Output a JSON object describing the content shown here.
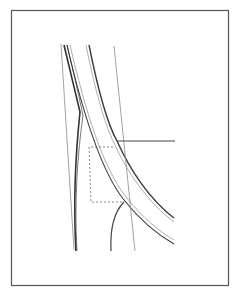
{
  "figure": {
    "width": 238,
    "height": 296,
    "background": "#ffffff",
    "frame": {
      "x": 11,
      "y": 10,
      "width": 218,
      "height": 276,
      "stroke": "#555555"
    },
    "colors": {
      "thin_line": "#8a8a8a",
      "thick_line": "#333333",
      "double_line_outer": "#3a3a3a",
      "double_line_inner": "#9a9a9a",
      "dashed": "#666666"
    }
  }
}
